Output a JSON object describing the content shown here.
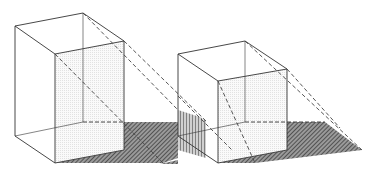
{
  "figure": {
    "title": "Shadow projection of two rectangular boxes",
    "colors": {
      "line": "#333333",
      "dash": "#444444",
      "shadow": "#555555",
      "face_tint": "#eeeeee",
      "background": "#ffffff"
    },
    "objects": [
      {
        "name": "tall-box",
        "position": "left"
      },
      {
        "name": "cube-box",
        "position": "right"
      }
    ]
  }
}
